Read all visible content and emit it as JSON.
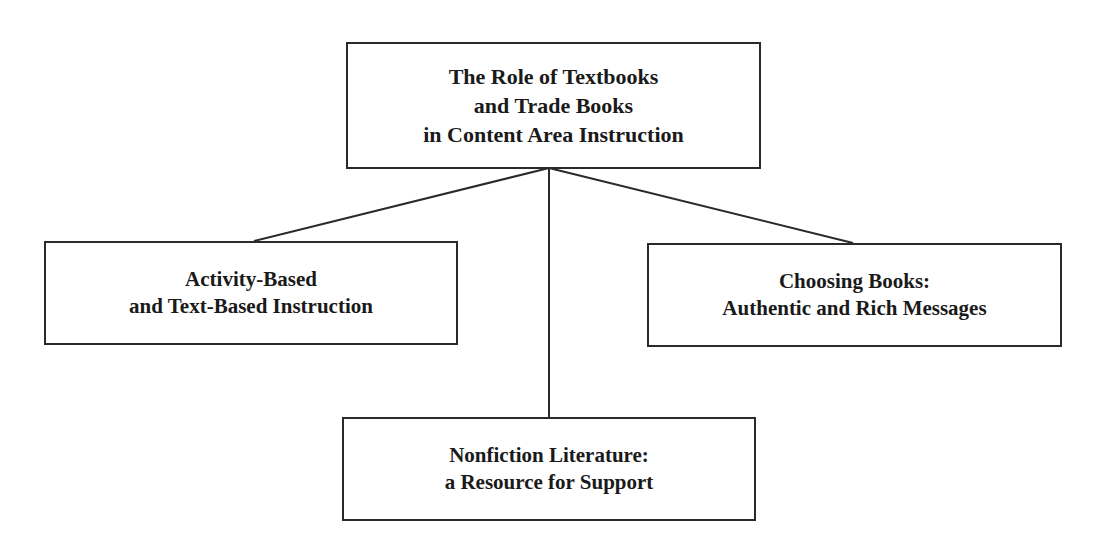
{
  "diagram": {
    "type": "hierarchy",
    "root": {
      "id": "root",
      "lines": [
        "The Role of Textbooks",
        "and Trade Books",
        "in Content Area Instruction"
      ]
    },
    "children": [
      {
        "id": "left",
        "lines": [
          "Activity-Based",
          "and Text-Based Instruction"
        ]
      },
      {
        "id": "right",
        "lines": [
          "Choosing Books:",
          "Authentic and Rich Messages"
        ]
      },
      {
        "id": "bottom",
        "lines": [
          "Nonfiction Literature:",
          "a Resource for Support"
        ]
      }
    ],
    "edges": [
      {
        "from": "root",
        "to": "left"
      },
      {
        "from": "root",
        "to": "bottom"
      },
      {
        "from": "root",
        "to": "right"
      }
    ],
    "colors": {
      "line": "#2a2a2a",
      "text": "#1a1a1a",
      "background": "#ffffff"
    }
  }
}
